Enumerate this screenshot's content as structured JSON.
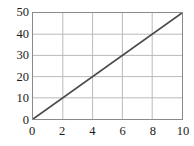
{
  "chart_data": {
    "type": "line",
    "title": "",
    "subtitle": "",
    "xlabel": "",
    "ylabel": "",
    "xlim": [
      0,
      10
    ],
    "ylim": [
      0,
      50
    ],
    "xticks": [
      0,
      2,
      4,
      6,
      8,
      10
    ],
    "yticks": [
      0,
      10,
      20,
      30,
      40,
      50
    ],
    "xtick_labels": [
      "0",
      "2",
      "4",
      "6",
      "8",
      "10"
    ],
    "ytick_labels": [
      "0",
      "10",
      "20",
      "30",
      "40",
      "50"
    ],
    "grid": true,
    "legend": null,
    "annotations": [],
    "series": [
      {
        "name": "",
        "x": [
          0,
          10
        ],
        "values": [
          0,
          50
        ],
        "slope": 5,
        "intercept": 0
      }
    ]
  },
  "style": {
    "background_color": "#ffffff",
    "plot_background_color": "#ffffff",
    "frame_color": "#8a8a8a",
    "grid_color": "#b9b9b9",
    "line_color": "#4a4a4a",
    "tick_label_color": "#1a1a1a"
  }
}
